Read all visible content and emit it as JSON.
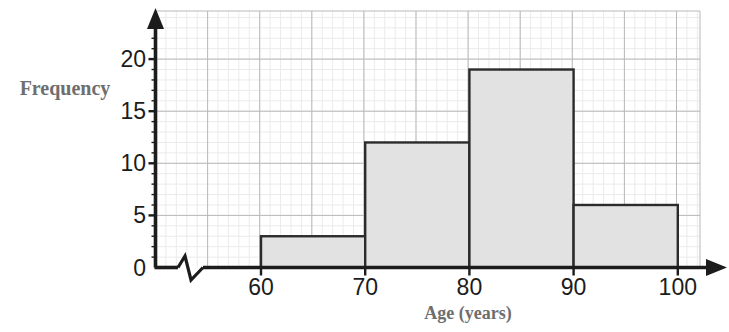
{
  "chart_data": {
    "type": "bar",
    "title": "",
    "xlabel": "Age (years)",
    "ylabel": "Frequency",
    "categories": [
      "60-70",
      "70-80",
      "80-90",
      "90-100"
    ],
    "bin_edges": [
      60,
      70,
      80,
      90,
      100
    ],
    "values": [
      3,
      12,
      19,
      6
    ],
    "xlim": [
      55,
      103
    ],
    "ylim": [
      0,
      23
    ],
    "xticks": [
      60,
      70,
      80,
      90,
      100
    ],
    "xtick_labels": [
      "60",
      "70",
      "80",
      "90",
      "100"
    ],
    "yticks": [
      0,
      5,
      10,
      15,
      20
    ],
    "ytick_labels": [
      "0",
      "5",
      "10",
      "15",
      "20"
    ],
    "y_minor_step": 1,
    "x_minor_step": 2,
    "grid": true,
    "grid_minor": true,
    "legend": "none",
    "axis_break": {
      "axis": "x",
      "symbol": "zigzag",
      "present": true
    },
    "colors": {
      "bar_fill": "#e2e2e2",
      "bar_stroke": "#2b2b2b",
      "axis": "#1c1c1c",
      "grid_major": "#b9b9b9",
      "grid_minor": "#ebebeb",
      "axis_title": "#6e6e6e",
      "tick_label": "#1c1c1c",
      "background": "#ffffff"
    }
  }
}
